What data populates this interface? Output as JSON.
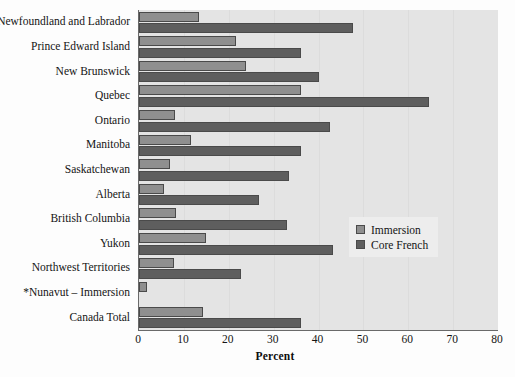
{
  "chart_data": {
    "type": "bar",
    "orientation": "horizontal",
    "title": "",
    "xlabel": "Percent",
    "ylabel": "",
    "xlim": [
      0,
      80
    ],
    "xticks": [
      0,
      10,
      20,
      30,
      40,
      50,
      60,
      70,
      80
    ],
    "grid": true,
    "legend_position": "right-middle",
    "categories": [
      "Newfoundland and Labrador",
      "Prince Edward Island",
      "New Brunswick",
      "Quebec",
      "Ontario",
      "Manitoba",
      "Saskatchewan",
      "Alberta",
      "British Columbia",
      "Yukon",
      "Northwest Territories",
      "*Nunavut – Immersion",
      "Canada Total"
    ],
    "series": [
      {
        "name": "Immersion",
        "color": "#8f8f8f",
        "values": [
          13.4,
          21.6,
          23.8,
          36.0,
          8.0,
          11.5,
          7.0,
          5.6,
          8.2,
          15.0,
          7.8,
          1.8,
          14.2
        ]
      },
      {
        "name": "Core French",
        "color": "#5e5e5e",
        "values": [
          47.7,
          36.0,
          40.0,
          64.6,
          42.5,
          36.0,
          33.4,
          26.7,
          33.0,
          43.2,
          22.7,
          null,
          36.0
        ]
      }
    ]
  },
  "legend": {
    "items": [
      {
        "label": "Immersion",
        "swatch": "immersion"
      },
      {
        "label": "Core French",
        "swatch": "core"
      }
    ]
  }
}
